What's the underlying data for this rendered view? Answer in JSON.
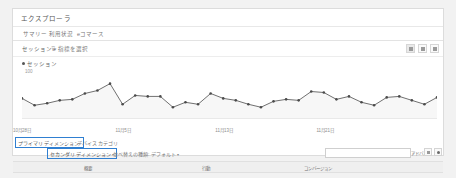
{
  "report": {
    "title": "エクスプローラ",
    "tabs": [
      {
        "label": "サマリー"
      },
      {
        "label": "利用状況"
      },
      {
        "label": "eコマース"
      }
    ]
  },
  "metric_bar": {
    "metric_label": "セッション",
    "caret": "▾",
    "filter_icon": "filter-icon",
    "select_metric_label": "指標を選択",
    "view_buttons": [
      {
        "name": "chart-view-button"
      },
      {
        "name": "table-view-button"
      },
      {
        "name": "more-view-button"
      }
    ]
  },
  "chart_data": {
    "type": "line",
    "title": "セッション",
    "legend": "セッション",
    "legend_position": "top-left",
    "ylabel": "100",
    "xlabel": "",
    "grid": false,
    "ylim": [
      0,
      110
    ],
    "categories": [
      "10月28日",
      "10月29日",
      "10月30日",
      "10月31日",
      "11月1日",
      "11月2日",
      "11月3日",
      "11月4日",
      "11月5日",
      "11月6日",
      "11月7日",
      "11月8日",
      "11月9日",
      "11月10日",
      "11月11日",
      "11月12日",
      "11月13日",
      "11月14日",
      "11月15日",
      "11月16日",
      "11月17日",
      "11月18日",
      "11月19日",
      "11月20日",
      "11月21日",
      "11月22日",
      "11月23日",
      "11月24日",
      "11月25日",
      "11月26日",
      "11月27日",
      "11月28日",
      "11月29日",
      "11月30日"
    ],
    "values": [
      42,
      28,
      32,
      38,
      40,
      52,
      58,
      72,
      30,
      48,
      46,
      46,
      24,
      34,
      30,
      52,
      42,
      38,
      30,
      24,
      36,
      40,
      38,
      56,
      54,
      40,
      46,
      34,
      28,
      44,
      46,
      38,
      30,
      44
    ],
    "tick_labels": [
      {
        "label": "10月28日",
        "index": 0
      },
      {
        "label": "11月5日",
        "index": 8
      },
      {
        "label": "11月13日",
        "index": 16
      },
      {
        "label": "11月21日",
        "index": 24
      }
    ]
  },
  "dimensions": {
    "primary_label": "プライマリ ディメンション:",
    "primary_value": "デバイス カテゴリ",
    "secondary_label": "セカンダリ ディメンション",
    "secondary_caret": "▾",
    "sort_label": "並べ替えの種類:",
    "sort_value": "デフォルト",
    "sort_caret": "▾"
  },
  "search": {
    "value": "",
    "placeholder": "",
    "icon": "search-icon",
    "advanced_label": "アドバンス"
  },
  "table": {
    "columns": [
      {
        "label": "概要",
        "x": 75
      },
      {
        "label": "行動",
        "x": 193
      },
      {
        "label": "コンバージョン",
        "x": 305
      }
    ]
  }
}
